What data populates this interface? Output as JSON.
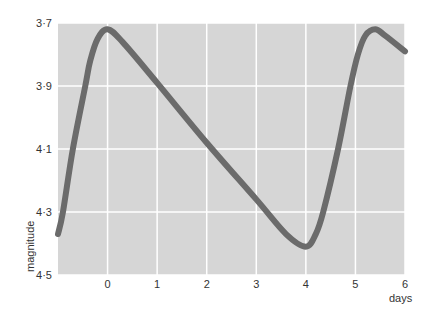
{
  "chart_data": {
    "type": "line",
    "title": "",
    "xlabel": "days",
    "ylabel": "magnitude",
    "xlim": [
      -1,
      6
    ],
    "ylim": [
      4.5,
      3.7
    ],
    "y_inverted": true,
    "grid": true,
    "legend": null,
    "x_ticks": [
      "0",
      "1",
      "2",
      "3",
      "4",
      "5",
      "6"
    ],
    "x_tick_values": [
      0,
      1,
      2,
      3,
      4,
      5,
      6
    ],
    "y_ticks": [
      "3·7",
      "3·9",
      "4·1",
      "4·3",
      "4·5"
    ],
    "y_tick_values": [
      3.7,
      3.9,
      4.1,
      4.3,
      4.5
    ],
    "series": [
      {
        "name": "light curve",
        "color": "#6b6b6b",
        "x": [
          -1.0,
          -0.9,
          -0.7,
          -0.45,
          -0.35,
          -0.2,
          0.0,
          0.3,
          1.0,
          2.0,
          3.0,
          3.6,
          4.0,
          4.2,
          4.35,
          4.65,
          4.9,
          5.05,
          5.2,
          5.4,
          5.6,
          6.0
        ],
        "y": [
          4.37,
          4.3,
          4.1,
          3.9,
          3.82,
          3.75,
          3.72,
          3.76,
          3.89,
          4.08,
          4.26,
          4.37,
          4.41,
          4.37,
          4.3,
          4.1,
          3.9,
          3.8,
          3.74,
          3.72,
          3.74,
          3.79
        ]
      }
    ]
  },
  "colors": {
    "plot_bg": "#d6d6d6",
    "grid": "#ffffff",
    "line": "#6b6b6b",
    "text": "#333333"
  }
}
